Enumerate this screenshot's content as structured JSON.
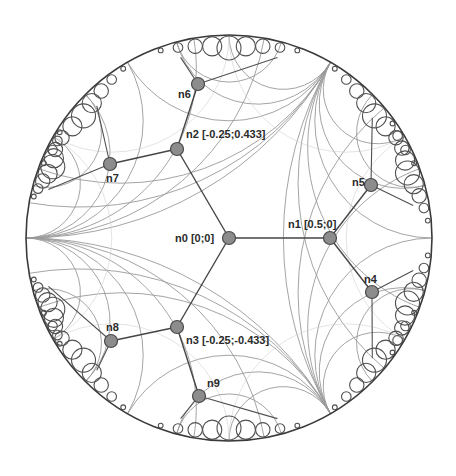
{
  "diagram": {
    "type": "hyperbolic-tree-embedding-poincare-disk",
    "disk": {
      "cx": 229,
      "cy": 238,
      "r": 203
    },
    "colors": {
      "disk_stroke": "#3a3a3a",
      "geodesic": "#9a9a9a",
      "edge": "#454545",
      "node_fill": "#8c8c8c",
      "node_stroke": "#4a4a4a",
      "label": "#2a2a2a"
    },
    "ideal_vertices": [
      {
        "x": 30,
        "y": 240
      },
      {
        "x": 324,
        "y": 64
      },
      {
        "x": 323,
        "y": 411
      },
      {
        "x": 127,
        "y": 63
      },
      {
        "x": 128,
        "y": 413
      },
      {
        "x": 420,
        "y": 238
      }
    ],
    "nodes": [
      {
        "id": "n0",
        "label": "n0 [0;0]",
        "x": 229,
        "y": 238,
        "lx": 175,
        "ly": 242
      },
      {
        "id": "n1",
        "label": "n1 [0.5;0]",
        "x": 330,
        "y": 238,
        "lx": 288,
        "ly": 228
      },
      {
        "id": "n2",
        "label": "n2 [-0.25;0.433]",
        "x": 177,
        "y": 149,
        "lx": 186,
        "ly": 138
      },
      {
        "id": "n3",
        "label": "n3 [-0.25;-0.433]",
        "x": 177,
        "y": 327,
        "lx": 186,
        "ly": 344
      },
      {
        "id": "n4",
        "label": "n4",
        "x": 372,
        "y": 292,
        "lx": 364,
        "ly": 283
      },
      {
        "id": "n5",
        "label": "n5",
        "x": 371,
        "y": 185,
        "lx": 352,
        "ly": 186
      },
      {
        "id": "n6",
        "label": "n6",
        "x": 198,
        "y": 84,
        "lx": 178,
        "ly": 98
      },
      {
        "id": "n7",
        "label": "n7",
        "x": 110,
        "y": 164,
        "lx": 106,
        "ly": 182
      },
      {
        "id": "n8",
        "label": "n8",
        "x": 111,
        "y": 341,
        "lx": 106,
        "ly": 331
      },
      {
        "id": "n9",
        "label": "n9",
        "x": 199,
        "y": 396,
        "lx": 207,
        "ly": 387
      }
    ],
    "edges": [
      [
        "n0",
        "n1"
      ],
      [
        "n0",
        "n2"
      ],
      [
        "n0",
        "n3"
      ],
      [
        "n1",
        "n4"
      ],
      [
        "n1",
        "n5"
      ],
      [
        "n2",
        "n6"
      ],
      [
        "n2",
        "n7"
      ],
      [
        "n3",
        "n8"
      ],
      [
        "n3",
        "n9"
      ]
    ]
  }
}
